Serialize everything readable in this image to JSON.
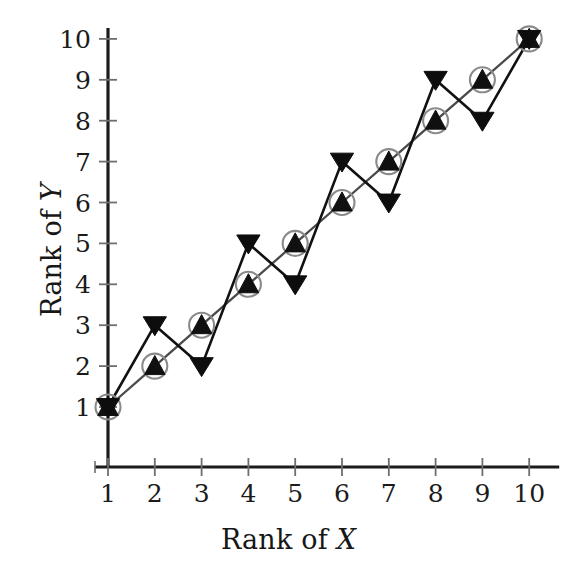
{
  "chart_data": {
    "type": "scatter",
    "title": "",
    "subtitle": "",
    "xlabel_prefix": "Rank of ",
    "xlabel_var": "X",
    "ylabel_prefix": "Rank of ",
    "ylabel_var": "Y",
    "xlabel": "Rank of X",
    "ylabel": "Rank of Y",
    "x": [
      1,
      2,
      3,
      4,
      5,
      6,
      7,
      8,
      9,
      10
    ],
    "xticks": [
      1,
      2,
      3,
      4,
      5,
      6,
      7,
      8,
      9,
      10
    ],
    "yticks": [
      1,
      2,
      3,
      4,
      5,
      6,
      7,
      8,
      9,
      10
    ],
    "xtick_labels": [
      "1",
      "2",
      "3",
      "4",
      "5",
      "6",
      "7",
      "8",
      "9",
      "10"
    ],
    "ytick_labels": [
      "1",
      "2",
      "3",
      "4",
      "5",
      "6",
      "7",
      "8",
      "9",
      "10"
    ],
    "xlim": [
      0.55,
      10.45
    ],
    "ylim": [
      0.3,
      10.45
    ],
    "grid": false,
    "legend": "none",
    "series": [
      {
        "name": "Rank of Y (circled up-triangle)",
        "marker": "triangle-up-in-circle",
        "marker_fill": "#101010",
        "marker_ring": "#8a8a8a",
        "line_color": "#4a4a4a",
        "values": [
          1,
          2,
          3,
          4,
          5,
          6,
          7,
          8,
          9,
          10
        ]
      },
      {
        "name": "Rank of Y (down-triangle)",
        "marker": "triangle-down",
        "marker_fill": "#0d0d0d",
        "marker_ring": "none",
        "line_color": "#111111",
        "values": [
          1,
          3,
          2,
          5,
          4,
          7,
          6,
          9,
          8,
          10
        ]
      }
    ],
    "colors": {
      "axis": "#1b1b1b",
      "background": "#ffffff",
      "text": "#171717"
    }
  },
  "geometry": {
    "x_origin_px": 108,
    "y_origin_px": 407,
    "x_step_px": 46.8,
    "y_step_px": 40.9,
    "axis_baseline_y_px": 467,
    "axis_spine_x_px": 108
  }
}
